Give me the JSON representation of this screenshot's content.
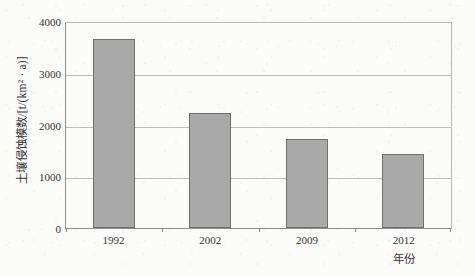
{
  "chart_data": {
    "type": "bar",
    "title": "",
    "categories": [
      "1992",
      "2002",
      "2009",
      "2012"
    ],
    "values": [
      3690,
      2250,
      1740,
      1450
    ],
    "series": [
      {
        "name": "土壤侵蚀模数",
        "values": [
          3690,
          2250,
          1740,
          1450
        ]
      }
    ],
    "xlabel": "年份",
    "ylabel": "土壤侵蚀模数/[t/(km² · a)]",
    "ylim": [
      0,
      4000
    ],
    "yticks": [
      "0",
      "1000",
      "2000",
      "3000",
      "4000"
    ],
    "ytick_values": [
      0,
      1000,
      2000,
      3000,
      4000
    ],
    "grid": true,
    "legend": false,
    "bar_fill_color": "#a9a9a9",
    "bar_border_color": "#6f6f6f",
    "gridline_color": "#bdbdbd",
    "axis_color": "#8d8d8d",
    "background_color": "#fbfbfa"
  }
}
